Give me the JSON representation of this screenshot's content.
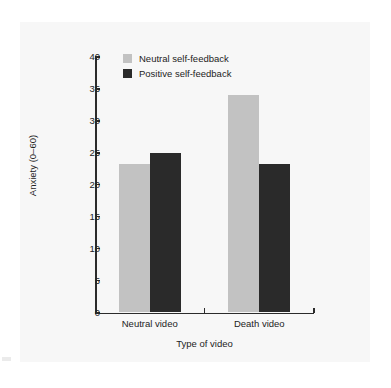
{
  "chart_data": {
    "type": "bar",
    "title": "",
    "subtitle": "",
    "xlabel": "Type of video",
    "ylabel": "Anxiety (0–60)",
    "categories": [
      "Neutral video",
      "Death video"
    ],
    "series": [
      {
        "name": "Neutral self-feedback",
        "color": "#c2c2c2",
        "values": [
          23.3,
          34.0
        ]
      },
      {
        "name": "Positive self-feedback",
        "color": "#2a2a2a",
        "values": [
          24.9,
          23.2
        ]
      }
    ],
    "ylim": [
      0,
      40
    ],
    "yticks": [
      0,
      5,
      10,
      15,
      20,
      25,
      30,
      35,
      40
    ],
    "ytick_labels": [
      "0",
      "5",
      "10",
      "15",
      "20",
      "25",
      "30",
      "35",
      "40"
    ],
    "grid": false,
    "legend_position": "top-left-inside",
    "legend_entries": [
      "Neutral self-feedback",
      "Positive self-feedback"
    ]
  },
  "figure": {
    "background_color": "#ffffff",
    "panel_color": "#f7f7f7",
    "axis_color": "#2b2b2b",
    "text_color": "#232323"
  }
}
